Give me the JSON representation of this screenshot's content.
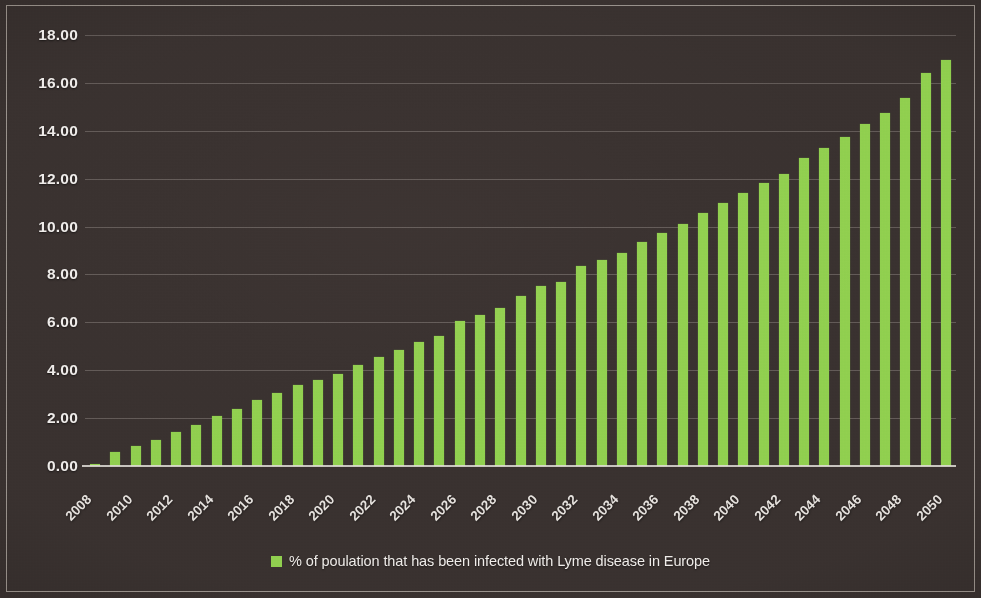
{
  "chart_data": {
    "type": "bar",
    "title": "",
    "subtitle": "",
    "xlabel": "",
    "ylabel": "",
    "ylim": [
      0,
      18
    ],
    "ytick_step": 2,
    "ytick_labels": [
      "18.00",
      "16.00",
      "14.00",
      "12.00",
      "10.00",
      "8.00",
      "6.00",
      "4.00",
      "2.00",
      "0.00"
    ],
    "ytick_values": [
      18,
      16,
      14,
      12,
      10,
      8,
      6,
      4,
      2,
      0
    ],
    "grid": true,
    "grid_axis": "y",
    "legend_position": "bottom",
    "xtick_interval": 2,
    "bar_color": "#92D050",
    "categories": [
      "2008",
      "2009",
      "2010",
      "2011",
      "2012",
      "2013",
      "2014",
      "2015",
      "2016",
      "2017",
      "2018",
      "2019",
      "2020",
      "2021",
      "2022",
      "2023",
      "2024",
      "2025",
      "2026",
      "2027",
      "2028",
      "2029",
      "2030",
      "2031",
      "2032",
      "2033",
      "2034",
      "2035",
      "2036",
      "2037",
      "2038",
      "2039",
      "2040",
      "2041",
      "2042",
      "2043",
      "2044",
      "2045",
      "2046",
      "2047",
      "2048",
      "2049",
      "2050"
    ],
    "xtick_labels": [
      "2008",
      "2010",
      "2012",
      "2014",
      "2016",
      "2018",
      "2020",
      "2022",
      "2024",
      "2026",
      "2028",
      "2030",
      "2032",
      "2034",
      "2036",
      "2038",
      "2040",
      "2042",
      "2044",
      "2046",
      "2048",
      "2050"
    ],
    "series": [
      {
        "name": "% of poulation that has been infected with Lyme disease in Europe",
        "color": "#92D050",
        "values": [
          0.1,
          0.6,
          0.85,
          1.1,
          1.4,
          1.7,
          2.1,
          2.4,
          2.75,
          3.05,
          3.4,
          3.6,
          3.85,
          4.2,
          4.55,
          4.85,
          5.2,
          5.45,
          6.05,
          6.3,
          6.6,
          7.1,
          7.5,
          7.7,
          8.35,
          8.6,
          8.9,
          9.35,
          9.75,
          10.1,
          10.55,
          11.0,
          11.4,
          11.8,
          12.2,
          12.85,
          13.3,
          13.75,
          14.3,
          14.75,
          15.35,
          16.4,
          16.95
        ]
      }
    ]
  },
  "legend": {
    "marker": "green-square-marker",
    "label": "% of poulation that has been infected with Lyme disease in Europe"
  }
}
